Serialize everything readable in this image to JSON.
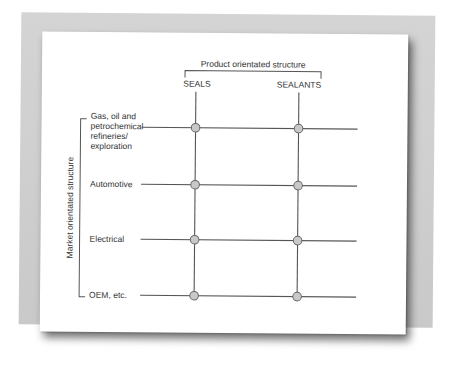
{
  "diagram": {
    "top_axis": {
      "title": "Product orientated structure",
      "columns": [
        {
          "label": "SEALS",
          "x": 195
        },
        {
          "label": "SEALANTS",
          "x": 299
        }
      ]
    },
    "side_axis": {
      "title": "Market orientated structure",
      "rows": [
        {
          "label_lines": [
            "Gas, oil and",
            "petrochemical",
            "refineries/",
            "exploration"
          ],
          "y": 128
        },
        {
          "label_lines": [
            "Automotive"
          ],
          "y": 185
        },
        {
          "label_lines": [
            "Electrical"
          ],
          "y": 240
        },
        {
          "label_lines": [
            "OEM, etc."
          ],
          "y": 296
        }
      ]
    },
    "colors": {
      "line": "#555555",
      "node_fill": "#c8c8c8",
      "node_stroke": "#666666",
      "frame": "#d0d0d0"
    }
  }
}
